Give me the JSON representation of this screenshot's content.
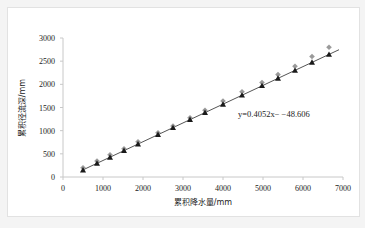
{
  "chart_data": {
    "type": "scatter",
    "title": "",
    "xlabel": "累积降水量/mm",
    "ylabel": "累积径流深/mm",
    "xlim": [
      0,
      7000
    ],
    "ylim": [
      0,
      3000
    ],
    "xticks": [
      "0",
      "1000",
      "2000",
      "3000",
      "4000",
      "5000",
      "6000",
      "7000"
    ],
    "yticks": [
      "0",
      "500",
      "1000",
      "1500",
      "2000",
      "2500",
      "3000"
    ],
    "grid": false,
    "legend": "none",
    "annotation": "y=0.4052x− −48.606",
    "fit": {
      "slope": 0.4052,
      "intercept": -48.606,
      "x_range": [
        500,
        6900
      ]
    },
    "series": [
      {
        "name": "observed",
        "marker": "diamond",
        "color": "#9a9a9a",
        "x": [
          500,
          850,
          1175,
          1525,
          1875,
          2375,
          2750,
          3175,
          3550,
          4000,
          4475,
          4975,
          5375,
          5800,
          6225,
          6650
        ],
        "y": [
          200,
          345,
          480,
          610,
          760,
          955,
          1100,
          1280,
          1440,
          1640,
          1840,
          2040,
          2210,
          2390,
          2600,
          2800
        ]
      },
      {
        "name": "simulated",
        "marker": "triangle",
        "color": "#1a1a1a",
        "x": [
          500,
          850,
          1175,
          1525,
          1875,
          2375,
          2750,
          3175,
          3550,
          4000,
          4475,
          4975,
          5375,
          5800,
          6225,
          6650
        ],
        "y": [
          150,
          295,
          425,
          570,
          710,
          915,
          1065,
          1240,
          1390,
          1570,
          1765,
          1970,
          2130,
          2300,
          2475,
          2645
        ]
      }
    ]
  }
}
